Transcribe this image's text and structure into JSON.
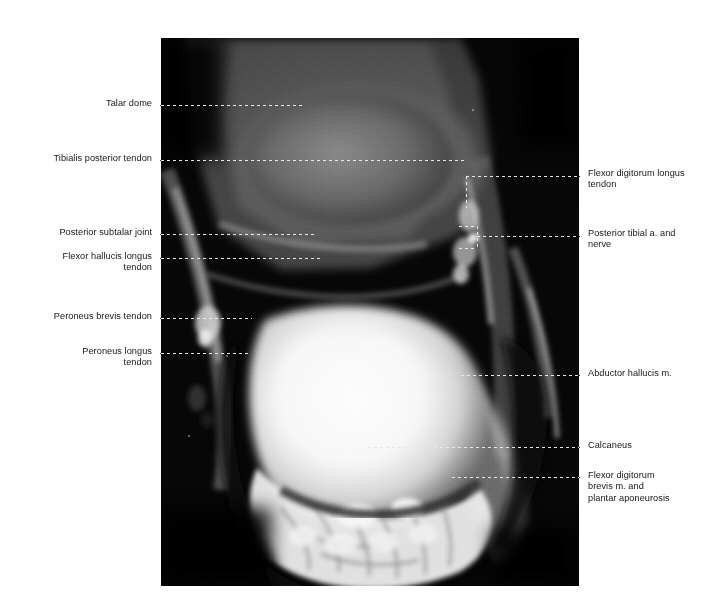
{
  "figure": {
    "modality": "MRI",
    "view": "coronal hindfoot",
    "plate": {
      "left": 161,
      "top": 38,
      "width": 418,
      "height": 548,
      "background_color": "#050505"
    }
  },
  "palette": {
    "paper": "#ffffff",
    "text": "#151515",
    "leader_dark": "#1a1a1a",
    "leader_light": "#e8e8e8",
    "image_black": "#050505",
    "image_white": "#ffffff"
  },
  "labels_left": [
    {
      "id": "talar-dome",
      "text": "Talar dome",
      "text_right": 152,
      "baseline_top": 98,
      "line_y": 105,
      "line_from": 160,
      "line_to": 302,
      "lines": 1
    },
    {
      "id": "tibialis-posterior-tendon",
      "text": "Tibialis posterior tendon",
      "text_right": 152,
      "baseline_top": 153,
      "line_y": 160,
      "line_from": 160,
      "line_to": 467,
      "lines": 1
    },
    {
      "id": "posterior-subtalar-joint",
      "text": "Posterior subtalar joint",
      "text_right": 152,
      "baseline_top": 227,
      "line_y": 234,
      "line_from": 160,
      "line_to": 315,
      "lines": 1
    },
    {
      "id": "flexor-hallucis-longus-tendon",
      "text": "Flexor hallucis longus\ntendon",
      "text_right": 152,
      "baseline_top": 251,
      "line_y": 258,
      "line_from": 160,
      "line_to": 320,
      "lines": 2
    },
    {
      "id": "peroneus-brevis-tendon",
      "text": "Peroneus brevis tendon",
      "text_right": 152,
      "baseline_top": 311,
      "line_y": 318,
      "line_from": 160,
      "line_to": 252,
      "lines": 1
    },
    {
      "id": "peroneus-longus-tendon",
      "text": "Peroneus longus\ntendon",
      "text_right": 152,
      "baseline_top": 346,
      "line_y": 353,
      "line_from": 160,
      "line_to": 248,
      "lines": 2
    }
  ],
  "labels_right": [
    {
      "id": "flexor-digitorum-longus-tendon",
      "text": "Flexor digitorum longus\ntendon",
      "text_left": 588,
      "baseline_top": 168,
      "line_y": 176,
      "line_from": 466,
      "line_to": 580,
      "lines": 2,
      "hook": {
        "x": 466,
        "from_y": 176,
        "to_y": 208
      }
    },
    {
      "id": "posterior-tibial-artery-and-nerve",
      "text": "Posterior tibial a. and\nnerve",
      "text_left": 588,
      "baseline_top": 228,
      "line_y": 236,
      "line_from": 477,
      "line_to": 580,
      "lines": 2,
      "bracket": {
        "x": 477,
        "top_y": 226,
        "bottom_y": 248,
        "tick_left": 459,
        "tick_width": 18
      }
    },
    {
      "id": "abductor-hallucis-m",
      "text": "Abductor hallucis m.",
      "text_left": 588,
      "baseline_top": 368,
      "line_y": 375,
      "line_from": 461,
      "line_to": 580,
      "lines": 1
    },
    {
      "id": "calcaneus",
      "text": "Calcaneus",
      "text_left": 588,
      "baseline_top": 440,
      "line_y": 447,
      "line_from": 368,
      "line_to": 580,
      "lines": 1
    },
    {
      "id": "flexor-digitorum-brevis-and-plantar-aponeurosis",
      "text": "Flexor digitorum\nbrevis m. and\nplantar aponeurosis",
      "text_left": 588,
      "baseline_top": 470,
      "line_y": 477,
      "line_from": 452,
      "line_to": 580,
      "lines": 3
    }
  ]
}
